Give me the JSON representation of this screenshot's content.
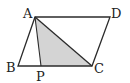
{
  "diagram": {
    "type": "parallelogram",
    "colors": {
      "stroke": "#2b2b2b",
      "shade": "#d4d4d4",
      "background": "#ffffff"
    },
    "points": {
      "A": {
        "label": "A",
        "x": 35,
        "y": 17
      },
      "D": {
        "label": "D",
        "x": 110,
        "y": 17
      },
      "B": {
        "label": "B",
        "x": 18,
        "y": 66
      },
      "C": {
        "label": "C",
        "x": 92,
        "y": 66
      },
      "P": {
        "label": "P",
        "x": 41,
        "y": 66
      }
    },
    "shaded_triangle": [
      "A",
      "P",
      "C"
    ],
    "segments": [
      [
        "A",
        "D"
      ],
      [
        "D",
        "C"
      ],
      [
        "C",
        "B"
      ],
      [
        "B",
        "A"
      ],
      [
        "A",
        "C"
      ],
      [
        "A",
        "P"
      ]
    ]
  }
}
